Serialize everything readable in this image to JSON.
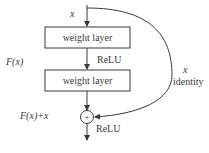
{
  "diagram": {
    "input_label": "x",
    "blocks": [
      {
        "label": "weight layer"
      },
      {
        "label": "weight layer"
      }
    ],
    "activations": [
      {
        "label": "ReLU"
      },
      {
        "label": "ReLU"
      }
    ],
    "function_label": "F(x)",
    "sum_label": "F(x)+x",
    "sum_symbol": "+",
    "shortcut": {
      "var_label": "x",
      "type_label": "identity"
    },
    "caption": "",
    "colors": {
      "stroke": "#3a3a3a",
      "text": "#3a3a3a",
      "background": "#ffffff"
    }
  }
}
